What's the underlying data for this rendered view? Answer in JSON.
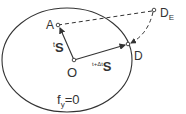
{
  "diagram": {
    "type": "yield-surface-return-mapping",
    "surface_label": {
      "main": "f",
      "sub": "y",
      "rest": "=0"
    },
    "points": {
      "A": {
        "label": "A"
      },
      "O": {
        "label": "O"
      },
      "D": {
        "label": "D"
      },
      "DE": {
        "label": "D",
        "sub": "E"
      }
    },
    "vectors": {
      "s_t": {
        "sup": "t",
        "main": "S"
      },
      "s_t_dt": {
        "sup": "t+Δt",
        "main": "S"
      }
    },
    "colors": {
      "stroke": "#333333",
      "background": "#ffffff"
    }
  }
}
